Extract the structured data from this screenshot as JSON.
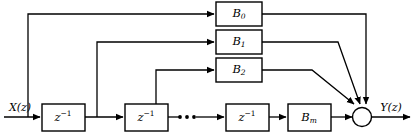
{
  "diagram": {
    "type": "fir-filter-block-diagram",
    "title": "",
    "input": {
      "label": "X(z)",
      "base": "X",
      "arg": "(z)"
    },
    "output": {
      "label": "Y(z)",
      "base": "Y",
      "arg": "(z)"
    },
    "delay_blocks": [
      {
        "id": "delay-1",
        "label": "z−1",
        "base": "z",
        "exponent": "−1"
      },
      {
        "id": "delay-2",
        "label": "z−1",
        "base": "z",
        "exponent": "−1"
      },
      {
        "id": "delay-3",
        "label": "z−1",
        "base": "z",
        "exponent": "−1"
      }
    ],
    "coefficient_blocks": [
      {
        "id": "coef-b0",
        "label": "B0",
        "base": "B",
        "subscript": "0"
      },
      {
        "id": "coef-b1",
        "label": "B1",
        "base": "B",
        "subscript": "1"
      },
      {
        "id": "coef-b2",
        "label": "B2",
        "base": "B",
        "subscript": "2"
      },
      {
        "id": "coef-bm",
        "label": "Bm",
        "base": "B",
        "subscript": "m"
      }
    ],
    "ellipsis": "• • •",
    "summing_node": {
      "id": "summing-junction",
      "label": ""
    },
    "colors": {
      "line": "#000000",
      "block_fill": "#ffffff",
      "background": "#ffffff"
    }
  }
}
